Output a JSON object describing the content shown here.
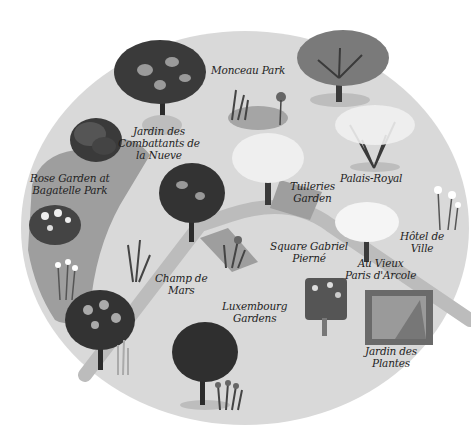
{
  "map": {
    "title": "Paris gardens illustrated map",
    "colors": {
      "background": "#ffffff",
      "land": "#d9d9d9",
      "zone": "#9e9e9e",
      "path": "#bcbcbc",
      "tree_dark": "#333333",
      "tree_mid": "#6e6e6e",
      "tree_light": "#f2f2f2",
      "trunk": "#3a3a3a",
      "shadow": "#bdbdbd",
      "text": "#1e1e1e"
    },
    "places": [
      {
        "id": "monceau",
        "label": "Monceau Park"
      },
      {
        "id": "combattants",
        "label": "Jardin des\nCombattants de\nla Nueve"
      },
      {
        "id": "bagatelle",
        "label": "Rose Garden at\nBagatelle Park"
      },
      {
        "id": "palais",
        "label": "Palais-Royal"
      },
      {
        "id": "tuileries",
        "label": "Tuileries\nGarden"
      },
      {
        "id": "hotel",
        "label": "Hôtel de\nVille"
      },
      {
        "id": "gabriel",
        "label": "Square Gabriel\nPierné"
      },
      {
        "id": "vieux",
        "label": "Au Vieux\nParis d'Arcole"
      },
      {
        "id": "champ",
        "label": "Champ de\nMars"
      },
      {
        "id": "luxembourg",
        "label": "Luxembourg\nGardens"
      },
      {
        "id": "plantes",
        "label": "Jardin des\nPlantes"
      }
    ]
  }
}
